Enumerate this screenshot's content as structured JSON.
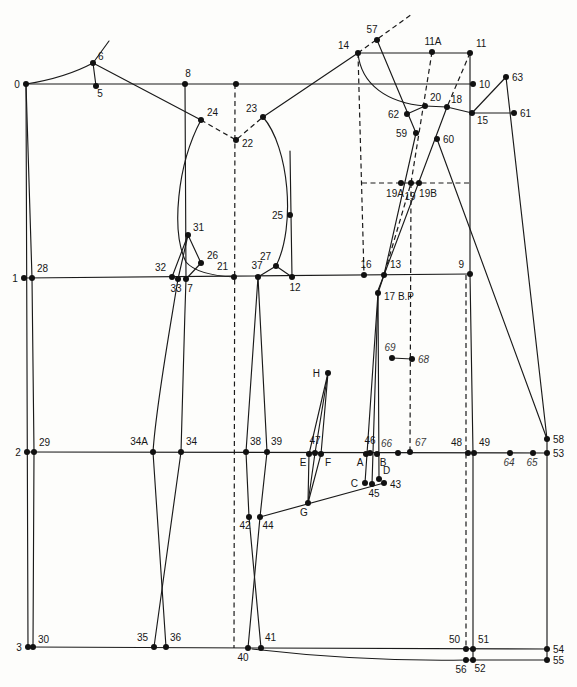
{
  "figure": {
    "width": 577,
    "height": 687,
    "background": "#fdfdfb",
    "line_color": "#1a1a1a",
    "dot_color": "#111111",
    "dot_radius": 3,
    "label_font_size": 10,
    "dash_pattern": "5,3.5"
  },
  "diagram": {
    "points": [
      {
        "id": "0",
        "label": "0",
        "x": 26,
        "y": 84,
        "lx": 17,
        "ly": 88,
        "a": "middle"
      },
      {
        "id": "6",
        "label": "6",
        "x": 93,
        "y": 63,
        "lx": 98,
        "ly": 60,
        "a": "start"
      },
      {
        "id": "5",
        "label": "5",
        "x": 96,
        "y": 86,
        "lx": 100,
        "ly": 97,
        "a": "middle"
      },
      {
        "id": "8",
        "label": "8",
        "x": 185,
        "y": 84,
        "lx": 188,
        "ly": 77,
        "a": "middle"
      },
      {
        "id": "t1",
        "label": "",
        "x": 236,
        "y": 84
      },
      {
        "id": "14",
        "label": "14",
        "x": 358,
        "y": 53,
        "lx": 349,
        "ly": 49,
        "a": "end"
      },
      {
        "id": "57",
        "label": "57",
        "x": 377,
        "y": 40,
        "lx": 372,
        "ly": 33,
        "a": "middle"
      },
      {
        "id": "11A",
        "label": "11A",
        "x": 432,
        "y": 52,
        "lx": 433,
        "ly": 45,
        "a": "middle"
      },
      {
        "id": "11",
        "label": "11",
        "x": 470,
        "y": 53,
        "lx": 476,
        "ly": 47,
        "a": "start"
      },
      {
        "id": "10",
        "label": "10",
        "x": 473,
        "y": 84,
        "lx": 479,
        "ly": 88,
        "a": "start"
      },
      {
        "id": "63",
        "label": "63",
        "x": 506,
        "y": 77,
        "lx": 512,
        "ly": 81,
        "a": "start"
      },
      {
        "id": "61",
        "label": "61",
        "x": 514,
        "y": 113,
        "lx": 520,
        "ly": 117,
        "a": "start"
      },
      {
        "id": "15",
        "label": "15",
        "x": 472,
        "y": 113,
        "lx": 477,
        "ly": 124,
        "a": "start"
      },
      {
        "id": "18",
        "label": "18",
        "x": 447,
        "y": 107,
        "lx": 451,
        "ly": 103,
        "a": "start"
      },
      {
        "id": "20",
        "label": "20",
        "x": 425,
        "y": 106,
        "lx": 430,
        "ly": 101,
        "a": "start"
      },
      {
        "id": "62",
        "label": "62",
        "x": 407,
        "y": 114,
        "lx": 399,
        "ly": 118,
        "a": "end"
      },
      {
        "id": "59",
        "label": "59",
        "x": 416,
        "y": 133,
        "lx": 407,
        "ly": 137,
        "a": "end"
      },
      {
        "id": "60",
        "label": "60",
        "x": 437,
        "y": 139,
        "lx": 443,
        "ly": 143,
        "a": "start"
      },
      {
        "id": "24",
        "label": "24",
        "x": 201,
        "y": 120,
        "lx": 207,
        "ly": 116,
        "a": "start"
      },
      {
        "id": "22",
        "label": "22",
        "x": 236,
        "y": 140,
        "lx": 242,
        "ly": 147,
        "a": "start"
      },
      {
        "id": "23",
        "label": "23",
        "x": 263,
        "y": 117,
        "lx": 257,
        "ly": 112,
        "a": "end"
      },
      {
        "id": "25",
        "label": "25",
        "x": 290,
        "y": 215,
        "lx": 283,
        "ly": 219,
        "a": "end"
      },
      {
        "id": "31",
        "label": "31",
        "x": 188,
        "y": 235,
        "lx": 193,
        "ly": 231,
        "a": "start"
      },
      {
        "id": "26",
        "label": "26",
        "x": 201,
        "y": 263,
        "lx": 207,
        "ly": 259,
        "a": "start"
      },
      {
        "id": "1",
        "label": "1",
        "x": 24,
        "y": 278,
        "lx": 15,
        "ly": 282,
        "a": "middle"
      },
      {
        "id": "28",
        "label": "28",
        "x": 32,
        "y": 278,
        "lx": 37,
        "ly": 272,
        "a": "start"
      },
      {
        "id": "32",
        "label": "32",
        "x": 172,
        "y": 277,
        "lx": 166,
        "ly": 271,
        "a": "end"
      },
      {
        "id": "33",
        "label": "33",
        "x": 178,
        "y": 279,
        "lx": 176,
        "ly": 292,
        "a": "middle"
      },
      {
        "id": "7",
        "label": "7",
        "x": 186,
        "y": 279,
        "lx": 190,
        "ly": 292,
        "a": "middle"
      },
      {
        "id": "21",
        "label": "21",
        "x": 234,
        "y": 277,
        "lx": 228,
        "ly": 270,
        "a": "end"
      },
      {
        "id": "37",
        "label": "37",
        "x": 258,
        "y": 277,
        "lx": 257,
        "ly": 269,
        "a": "middle"
      },
      {
        "id": "27",
        "label": "27",
        "x": 276,
        "y": 266,
        "lx": 271,
        "ly": 260,
        "a": "end"
      },
      {
        "id": "12",
        "label": "12",
        "x": 292,
        "y": 277,
        "lx": 295,
        "ly": 291,
        "a": "middle"
      },
      {
        "id": "16",
        "label": "16",
        "x": 364,
        "y": 275,
        "lx": 366,
        "ly": 268,
        "a": "middle"
      },
      {
        "id": "13",
        "label": "13",
        "x": 384,
        "y": 275,
        "lx": 390,
        "ly": 268,
        "a": "start"
      },
      {
        "id": "9",
        "label": "9",
        "x": 470,
        "y": 274,
        "lx": 464,
        "ly": 268,
        "a": "end"
      },
      {
        "id": "17",
        "label": "17 B.P",
        "x": 378,
        "y": 293,
        "lx": 384,
        "ly": 300,
        "a": "start"
      },
      {
        "id": "19A",
        "label": "19A",
        "x": 401,
        "y": 183,
        "lx": 395,
        "ly": 197,
        "a": "middle"
      },
      {
        "id": "19",
        "label": "19",
        "x": 411,
        "y": 183,
        "lx": 410,
        "ly": 200,
        "a": "middle"
      },
      {
        "id": "19B",
        "label": "19B",
        "x": 419,
        "y": 183,
        "lx": 428,
        "ly": 197,
        "a": "middle"
      },
      {
        "id": "69",
        "label": "69",
        "x": 392,
        "y": 358,
        "lx": 390,
        "ly": 351,
        "a": "middle",
        "i": true
      },
      {
        "id": "68",
        "label": "68",
        "x": 412,
        "y": 359,
        "lx": 418,
        "ly": 363,
        "a": "start",
        "i": true
      },
      {
        "id": "H",
        "label": "H",
        "x": 328,
        "y": 373,
        "lx": 320,
        "ly": 377,
        "a": "end"
      },
      {
        "id": "2",
        "label": "2",
        "x": 27,
        "y": 452,
        "lx": 18,
        "ly": 456,
        "a": "middle"
      },
      {
        "id": "29",
        "label": "29",
        "x": 34,
        "y": 452,
        "lx": 39,
        "ly": 446,
        "a": "start"
      },
      {
        "id": "34A",
        "label": "34A",
        "x": 153,
        "y": 452,
        "lx": 148,
        "ly": 445,
        "a": "end"
      },
      {
        "id": "34",
        "label": "34",
        "x": 181,
        "y": 452,
        "lx": 186,
        "ly": 445,
        "a": "start"
      },
      {
        "id": "38",
        "label": "38",
        "x": 246,
        "y": 452,
        "lx": 250,
        "ly": 445,
        "a": "start"
      },
      {
        "id": "39",
        "label": "39",
        "x": 267,
        "y": 452,
        "lx": 271,
        "ly": 445,
        "a": "start"
      },
      {
        "id": "E",
        "label": "E",
        "x": 309,
        "y": 454,
        "lx": 303,
        "ly": 466,
        "a": "middle"
      },
      {
        "id": "47",
        "label": "47",
        "x": 315,
        "y": 453,
        "lx": 315,
        "ly": 444,
        "a": "middle"
      },
      {
        "id": "F",
        "label": "F",
        "x": 321,
        "y": 454,
        "lx": 328,
        "ly": 466,
        "a": "middle"
      },
      {
        "id": "A",
        "label": "A",
        "x": 366,
        "y": 454,
        "lx": 360,
        "ly": 466,
        "a": "middle"
      },
      {
        "id": "46",
        "label": "46",
        "x": 370,
        "y": 453,
        "lx": 370,
        "ly": 444,
        "a": "middle"
      },
      {
        "id": "B",
        "label": "B",
        "x": 377,
        "y": 454,
        "lx": 383,
        "ly": 466,
        "a": "middle"
      },
      {
        "id": "66",
        "label": "66",
        "x": 398,
        "y": 453,
        "lx": 392,
        "ly": 447,
        "a": "end",
        "i": true
      },
      {
        "id": "67",
        "label": "67",
        "x": 410,
        "y": 452,
        "lx": 415,
        "ly": 446,
        "a": "start",
        "i": true
      },
      {
        "id": "48",
        "label": "48",
        "x": 468,
        "y": 453,
        "lx": 462,
        "ly": 446,
        "a": "end"
      },
      {
        "id": "49",
        "label": "49",
        "x": 474,
        "y": 453,
        "lx": 479,
        "ly": 446,
        "a": "start"
      },
      {
        "id": "64",
        "label": "64",
        "x": 510,
        "y": 453,
        "lx": 509,
        "ly": 466,
        "a": "middle",
        "i": true
      },
      {
        "id": "65",
        "label": "65",
        "x": 533,
        "y": 453,
        "lx": 532,
        "ly": 466,
        "a": "middle",
        "i": true
      },
      {
        "id": "53",
        "label": "53",
        "x": 547,
        "y": 453,
        "lx": 553,
        "ly": 457,
        "a": "start"
      },
      {
        "id": "58",
        "label": "58",
        "x": 547,
        "y": 439,
        "lx": 553,
        "ly": 443,
        "a": "start"
      },
      {
        "id": "C",
        "label": "C",
        "x": 365,
        "y": 483,
        "lx": 358,
        "ly": 487,
        "a": "end"
      },
      {
        "id": "45",
        "label": "45",
        "x": 372,
        "y": 484,
        "lx": 374,
        "ly": 497,
        "a": "middle"
      },
      {
        "id": "D",
        "label": "D",
        "x": 379,
        "y": 479,
        "lx": 383,
        "ly": 474,
        "a": "start"
      },
      {
        "id": "43",
        "label": "43",
        "x": 384,
        "y": 483,
        "lx": 390,
        "ly": 488,
        "a": "start"
      },
      {
        "id": "G",
        "label": "G",
        "x": 308,
        "y": 503,
        "lx": 304,
        "ly": 516,
        "a": "middle"
      },
      {
        "id": "42",
        "label": "42",
        "x": 249,
        "y": 517,
        "lx": 245,
        "ly": 529,
        "a": "middle"
      },
      {
        "id": "44",
        "label": "44",
        "x": 260,
        "y": 517,
        "lx": 268,
        "ly": 529,
        "a": "middle"
      },
      {
        "id": "3",
        "label": "3",
        "x": 28,
        "y": 647,
        "lx": 19,
        "ly": 651,
        "a": "middle"
      },
      {
        "id": "30",
        "label": "30",
        "x": 33,
        "y": 647,
        "lx": 38,
        "ly": 643,
        "a": "start"
      },
      {
        "id": "35",
        "label": "35",
        "x": 154,
        "y": 647,
        "lx": 148,
        "ly": 641,
        "a": "end"
      },
      {
        "id": "36",
        "label": "36",
        "x": 166,
        "y": 647,
        "lx": 170,
        "ly": 641,
        "a": "start"
      },
      {
        "id": "40",
        "label": "40",
        "x": 248,
        "y": 648,
        "lx": 243,
        "ly": 661,
        "a": "middle"
      },
      {
        "id": "41",
        "label": "41",
        "x": 261,
        "y": 648,
        "lx": 265,
        "ly": 641,
        "a": "start"
      },
      {
        "id": "50",
        "label": "50",
        "x": 466,
        "y": 649,
        "lx": 460,
        "ly": 643,
        "a": "end"
      },
      {
        "id": "51",
        "label": "51",
        "x": 473,
        "y": 649,
        "lx": 478,
        "ly": 643,
        "a": "start"
      },
      {
        "id": "56",
        "label": "56",
        "x": 466,
        "y": 660,
        "lx": 461,
        "ly": 673,
        "a": "middle"
      },
      {
        "id": "52",
        "label": "52",
        "x": 473,
        "y": 660,
        "lx": 480,
        "ly": 672,
        "a": "middle"
      },
      {
        "id": "54",
        "label": "54",
        "x": 547,
        "y": 649,
        "lx": 553,
        "ly": 653,
        "a": "start"
      },
      {
        "id": "55",
        "label": "55",
        "x": 547,
        "y": 660,
        "lx": 553,
        "ly": 664,
        "a": "start"
      }
    ],
    "solid_paths": [
      {
        "name": "top-construction-line",
        "d": "M26,84 L473,84"
      },
      {
        "name": "shoulder-line-14-11",
        "d": "M358,53 L470,53"
      },
      {
        "name": "bust-line-1-9",
        "d": "M24,278 L470,274"
      },
      {
        "name": "waist-line-2-53",
        "d": "M27,452 L547,453"
      },
      {
        "name": "hem-line-3-54",
        "d": "M28,647 L261,648 L547,649"
      },
      {
        "name": "hem-curve-lower",
        "d": "M252,649 C330,658 405,661 466,660 L547,660"
      },
      {
        "name": "left-vertical-0-3",
        "d": "M26,84 L28,647"
      },
      {
        "name": "left-vertical-28-30",
        "d": "M26,84 L32,278 L34,452 L33,647"
      },
      {
        "name": "back-vertical-8-7",
        "d": "M185,84 L186,279"
      },
      {
        "name": "center-front-vertical-11-52",
        "d": "M470,54 L470,274 L473,453 L473,660"
      },
      {
        "name": "right-edge-vertical-58-55",
        "d": "M547,439 L547,660"
      },
      {
        "name": "back-neck-curve-0-6",
        "d": "M26,84 C58,79 80,70 93,63"
      },
      {
        "name": "segment-6-5",
        "d": "M93,63 L96,86"
      },
      {
        "name": "segment-6-stub",
        "d": "M93,63 L109,41"
      },
      {
        "name": "shoulder-6-24",
        "d": "M93,63 L201,120"
      },
      {
        "name": "shoulder-23-14",
        "d": "M263,117 L358,53"
      },
      {
        "name": "front-neck-curve-14-20",
        "d": "M358,53 C361,85 388,103 425,106"
      },
      {
        "name": "segment-20-18-15",
        "d": "M425,106 L447,107 L472,113"
      },
      {
        "name": "segment-62-20",
        "d": "M407,114 L425,106"
      },
      {
        "name": "dart-leg-57-59",
        "d": "M377,40 L416,133"
      },
      {
        "name": "dart-leg-59-13-17",
        "d": "M416,133 L384,275 L378,293"
      },
      {
        "name": "dart-leg-18-60-13-17",
        "d": "M447,107 L384,275 L377,293"
      },
      {
        "name": "side-line-60-58",
        "d": "M437,139 L547,439"
      },
      {
        "name": "segment-15-63",
        "d": "M472,113 L506,77"
      },
      {
        "name": "side-line-63-58",
        "d": "M506,77 L547,439"
      },
      {
        "name": "segment-15-61",
        "d": "M472,113 L514,113"
      },
      {
        "name": "segment-69-68",
        "d": "M392,358 L412,359"
      },
      {
        "name": "back-armhole-24-21",
        "d": "M201,120 C177,165 171,232 186,262 Q197,275 234,277"
      },
      {
        "name": "dart-31-32",
        "d": "M188,235 L172,277"
      },
      {
        "name": "dart-31-33",
        "d": "M188,235 L178,279"
      },
      {
        "name": "dart-31-26",
        "d": "M188,235 L201,263"
      },
      {
        "name": "dart-26-7",
        "d": "M201,263 L186,279"
      },
      {
        "name": "front-armhole-23-27",
        "d": "M263,117 C289,147 296,226 276,266"
      },
      {
        "name": "segment-27-37",
        "d": "M276,266 L258,277"
      },
      {
        "name": "segment-27-12",
        "d": "M276,266 L292,277"
      },
      {
        "name": "vertical-25-12",
        "d": "M290,151 L292,277"
      },
      {
        "name": "seam-33-34A",
        "d": "M178,279 C168,340 156,406 153,452"
      },
      {
        "name": "seam-7-34",
        "d": "M186,279 C184,340 182,406 181,452"
      },
      {
        "name": "seam-34A-36",
        "d": "M153,452 L166,647"
      },
      {
        "name": "seam-34-35",
        "d": "M181,452 L154,647"
      },
      {
        "name": "dart-37-38",
        "d": "M258,277 L246,452"
      },
      {
        "name": "dart-37-39",
        "d": "M258,277 L267,452"
      },
      {
        "name": "seam-38-42",
        "d": "M246,452 L249,517"
      },
      {
        "name": "seam-39-44",
        "d": "M267,452 L260,517"
      },
      {
        "name": "seam-42-41",
        "d": "M249,517 L261,648"
      },
      {
        "name": "seam-44-40",
        "d": "M260,517 L248,648"
      },
      {
        "name": "dart-17-C",
        "d": "M378,293 L365,483"
      },
      {
        "name": "dart-17-45",
        "d": "M378,293 L372,484"
      },
      {
        "name": "dart-17-D",
        "d": "M378,293 L379,479"
      },
      {
        "name": "line-44-G-43",
        "d": "M260,517 L384,483"
      },
      {
        "name": "spindle-H-E-G",
        "d": "M328,373 L309,454 L308,503"
      },
      {
        "name": "spindle-H-F-G",
        "d": "M328,373 L321,454 L308,503"
      },
      {
        "name": "spindle-H-47-G",
        "d": "M328,373 L315,453 L308,503"
      }
    ],
    "dashed_paths": [
      {
        "name": "center-dashed-vertical-22-21",
        "d": "M235,84 L234,648"
      },
      {
        "name": "dart-dashed-24-22-23",
        "d": "M201,120 L236,140 L263,117"
      },
      {
        "name": "dashed-extension-14-57",
        "d": "M358,53 L412,14"
      },
      {
        "name": "dashed-vertical-14-16",
        "d": "M358,53 L364,275"
      },
      {
        "name": "dashed-horizontal-19-level",
        "d": "M362,183 L470,183"
      },
      {
        "name": "dashed-11A-19-13",
        "d": "M432,52 L411,183 L384,275"
      },
      {
        "name": "dashed-11-18",
        "d": "M470,53 L447,107"
      },
      {
        "name": "dashed-vertical-19-67",
        "d": "M411,183 L410,452"
      },
      {
        "name": "dashed-vertical-48-50",
        "d": "M466,275 L466,649"
      }
    ]
  }
}
